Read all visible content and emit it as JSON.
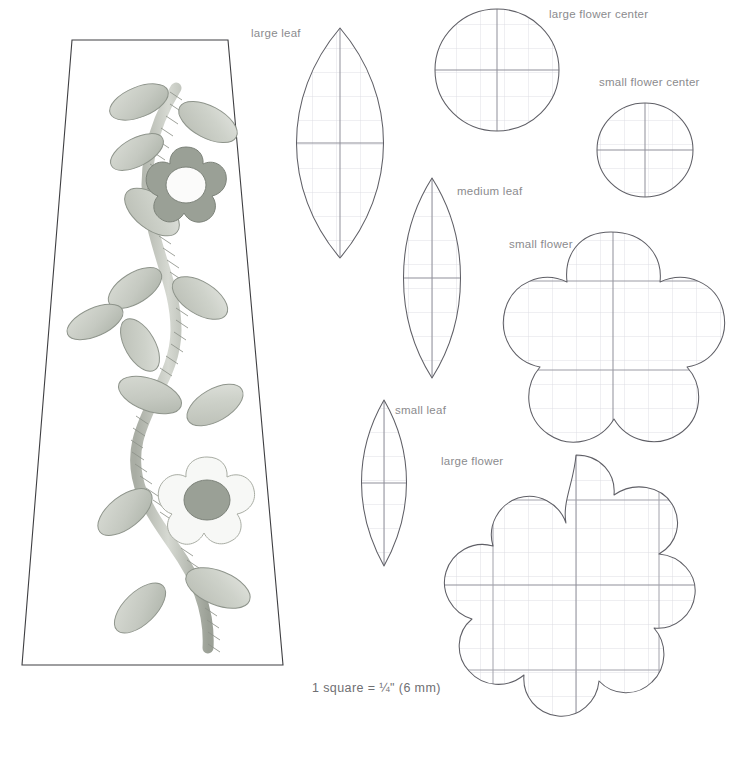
{
  "sheet": {
    "title": "Appliqué pattern templates",
    "background": "#ffffff",
    "label_color": "#8b8b8e",
    "outline_color": "#5c5c60",
    "grid_color": "#c9c9d2",
    "axis_color": "#9a9aa2"
  },
  "scale_note": {
    "text": "1 square = ¼\" (6 mm)",
    "prefix": "1 square =",
    "fraction": "¼\"",
    "metric": "(6 mm)"
  },
  "panel": {
    "name": "appliqué sample panel",
    "shape": "trapezoid",
    "motif": "braided vine with leaves and two flowers",
    "leaf_fill": "#c8cbc4",
    "leaf_stroke": "#8e948b",
    "vine_fill": "#b6bab2",
    "flower_dark_fill": "#9aa096",
    "flower_light_fill": "#f3f4f1",
    "flower_center_fill": "#9aa096"
  },
  "templates": [
    {
      "id": "large-leaf",
      "label": "large leaf",
      "shape": "pointed-oval"
    },
    {
      "id": "large-flower-center",
      "label": "large flower center",
      "shape": "circle"
    },
    {
      "id": "small-flower-center",
      "label": "small flower center",
      "shape": "circle"
    },
    {
      "id": "medium-leaf",
      "label": "medium leaf",
      "shape": "pointed-oval"
    },
    {
      "id": "small-flower",
      "label": "small flower",
      "shape": "5-petal-flower"
    },
    {
      "id": "small-leaf",
      "label": "small leaf",
      "shape": "pointed-oval"
    },
    {
      "id": "large-flower",
      "label": "large flower",
      "shape": "10-petal-flower"
    }
  ],
  "labels": {
    "large_leaf": "large leaf",
    "large_flower_center": "large flower center",
    "small_flower_center": "small flower center",
    "medium_leaf": "medium leaf",
    "small_flower": "small flower",
    "small_leaf": "small leaf",
    "large_flower": "large flower"
  }
}
